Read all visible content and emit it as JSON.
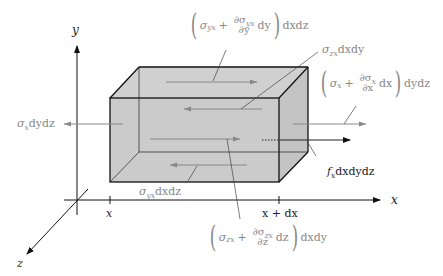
{
  "diagram": {
    "colors": {
      "box_fill": "#cccccc",
      "box_edge": "#1a1a1a",
      "stress_arrow": "#888888",
      "axis": "#111111",
      "label_gray": "#888888",
      "label_dark": "#222222"
    },
    "axes": {
      "x_label": "x",
      "y_label": "y",
      "z_label": "z",
      "tick_x_label": "x",
      "tick_x_plus_dx_label": "x + dx"
    },
    "labels": {
      "sigma_x_left": {
        "symbol": "σ",
        "sub": "x",
        "tail": "dydz"
      },
      "sigma_x_right": {
        "open": "(",
        "base": "σ",
        "base_sub": "x",
        "plus": "+",
        "num": "∂σ",
        "num_sub": "x",
        "den": "∂x",
        "diff": "dx",
        "close": ")",
        "tail": "dydz"
      },
      "sigma_yx_top": {
        "open": "(",
        "base": "σ",
        "base_sub": "yx",
        "plus": "+",
        "num": "∂σ",
        "num_sub": "yx",
        "den": "∂y",
        "diff": "dy",
        "close": ")",
        "tail": "dxdz"
      },
      "sigma_yx_bottom": {
        "symbol": "σ",
        "sub": "yx",
        "tail": "dxdz"
      },
      "sigma_zx_back": {
        "symbol": "σ",
        "sub": "zx",
        "tail": "dxdy"
      },
      "sigma_zx_front": {
        "open": "(",
        "base": "σ",
        "base_sub": "zx",
        "plus": "+",
        "num": "∂σ",
        "num_sub": "zx",
        "den": "∂z",
        "diff": "dz",
        "close": ")",
        "tail": "dxdy"
      },
      "body_force": {
        "symbol": "f",
        "sub": "x",
        "tail": "dxdydz"
      }
    }
  }
}
